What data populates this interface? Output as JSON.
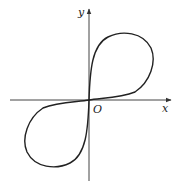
{
  "figure": {
    "axes": {
      "x_label": "x",
      "y_label": "y",
      "origin_label": "O"
    },
    "curve": {
      "color": "#222222",
      "lobes": [
        "quadrant-I",
        "quadrant-III"
      ]
    },
    "colors": {
      "axis": "#444444",
      "background": "#ffffff"
    }
  }
}
